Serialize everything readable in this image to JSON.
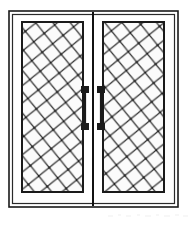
{
  "figure": {
    "view": "front-elevation",
    "background_color": "#ffffff",
    "line_color": "#1a1a1a",
    "glass_fill": "#fbfbfb",
    "frame_fill": "#ffffff",
    "lattice_color": "#3a3a3a",
    "handle_color": "#1a1a1a",
    "mullion_color": "#111111"
  },
  "geometry": {
    "canvas": {
      "width": 191,
      "height": 226
    },
    "outer_frame": {
      "x": 9,
      "y": 11,
      "width": 169,
      "height": 196,
      "stroke_width": 1.6
    },
    "inner_frame": {
      "x": 12,
      "y": 14,
      "width": 163,
      "height": 190,
      "stroke_width": 1.2
    },
    "center_mullion": {
      "x": 93,
      "y_top": 12,
      "y_bottom": 206,
      "stroke_width": 2.0
    },
    "leaves": [
      {
        "name": "left-door-leaf",
        "x": 14,
        "y": 16,
        "width": 77,
        "height": 186,
        "glass": {
          "x": 22,
          "y": 22,
          "width": 61,
          "height": 170
        },
        "lattice_direction": "down-right-leaning",
        "handle": {
          "name": "left-door-handle",
          "bar_x": 85,
          "bar_top": 91,
          "bar_bottom": 126,
          "bar_width": 2.2,
          "mounts": [
            {
              "x": 81,
              "y": 86,
              "width": 8,
              "height": 7
            },
            {
              "x": 81,
              "y": 123,
              "width": 8,
              "height": 7
            }
          ]
        }
      },
      {
        "name": "right-door-leaf",
        "x": 95,
        "y": 16,
        "width": 77,
        "height": 186,
        "glass": {
          "x": 103,
          "y": 22,
          "width": 61,
          "height": 170
        },
        "lattice_direction": "down-right-leaning",
        "handle": {
          "name": "right-door-handle",
          "bar_x": 101,
          "bar_top": 91,
          "bar_bottom": 126,
          "bar_width": 2.2,
          "mounts": [
            {
              "x": 97,
              "y": 86,
              "width": 8,
              "height": 7
            },
            {
              "x": 97,
              "y": 123,
              "width": 8,
              "height": 7
            }
          ]
        }
      }
    ],
    "lattice": {
      "cell_pitch": 19,
      "tilt_degrees": 6,
      "stroke_width": 1.3,
      "node_radius": 1.1,
      "description": "criss-cross diagonal muntin grid forming diamond panes"
    }
  },
  "labels": {
    "left_leaf": "Left door leaf",
    "right_leaf": "Right door leaf",
    "handle_left": "Left pull handle",
    "handle_right": "Right pull handle",
    "frame": "Door frame",
    "mullion": "Meeting stile"
  },
  "artifacts": {
    "bottom_scan_noise": "faint horizontal speckle band along lower edge of scan"
  }
}
